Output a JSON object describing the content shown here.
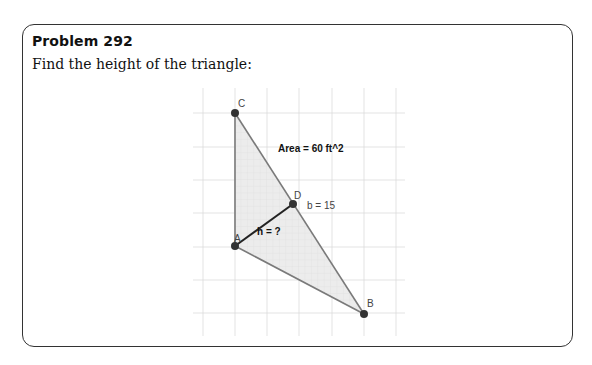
{
  "problem": {
    "title": "Problem 292",
    "prompt": "Find the height of the triangle:"
  },
  "figure": {
    "points": [
      {
        "name": "C",
        "label": "C"
      },
      {
        "name": "D",
        "label": "D"
      },
      {
        "name": "A",
        "label": "A"
      },
      {
        "name": "B",
        "label": "B"
      }
    ],
    "area_label": "Area = 60 ft^2",
    "base_label": "b = 15",
    "height_label": "h = ?",
    "colors": {
      "fill": "#e6e6e6",
      "edge": "#777777",
      "height_segment": "#222222",
      "point": "#333333",
      "grid": "#dddddd"
    }
  }
}
